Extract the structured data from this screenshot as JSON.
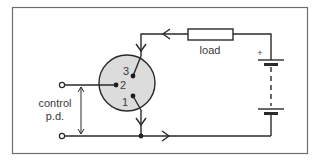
{
  "diagram": {
    "labels": {
      "load": "load",
      "control_line1": "control",
      "control_line2": "p.d.",
      "battery_positive": "+",
      "pin1": "1",
      "pin2": "2",
      "pin3": "3"
    },
    "components": [
      {
        "id": "transistor",
        "type": "three-terminal device",
        "pins": [
          "1",
          "2",
          "3"
        ]
      },
      {
        "id": "load",
        "type": "resistor",
        "label": "load"
      },
      {
        "id": "battery",
        "type": "multi-cell battery",
        "polarity_mark": "+"
      },
      {
        "id": "control-input",
        "type": "input terminals",
        "label": "control p.d."
      }
    ],
    "colors": {
      "line": "#2a2a2a",
      "frame": "#6e6e6e",
      "transistor_fill": "#dcdcdc",
      "background": "#ffffff"
    }
  }
}
